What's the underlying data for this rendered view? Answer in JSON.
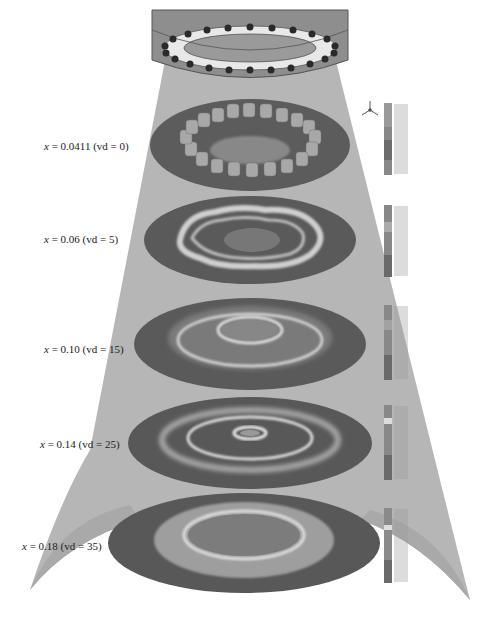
{
  "figure": {
    "colors": {
      "cone": "#b4b4b4",
      "nozzle": "#8e8e8e",
      "disc_outer": "#5a5a5a",
      "disc_mid": "#7a7a7a",
      "ring_light": "#d6d6d6",
      "background": "#ffffff"
    },
    "nozzle": {
      "orifice_count": 24,
      "orifice_color": "#2a2a2a"
    },
    "slices": [
      {
        "x_label": "x",
        "x_value": "= 0.0411",
        "vd_label": "(vd = 0)",
        "pattern": "discrete-jets"
      },
      {
        "x_label": "x",
        "x_value": "= 0.06",
        "vd_label": "(vd = 5)",
        "pattern": "wavy-ring"
      },
      {
        "x_label": "x",
        "x_value": "= 0.10",
        "vd_label": "(vd = 15)",
        "pattern": "double-ring"
      },
      {
        "x_label": "x",
        "x_value": "= 0.14",
        "vd_label": "(vd = 25)",
        "pattern": "triple-ring"
      },
      {
        "x_label": "x",
        "x_value": "= 0.18",
        "vd_label": "(vd = 35)",
        "pattern": "single-ring"
      }
    ],
    "axis_triad_icon": "xyz-triad-icon",
    "legend_count": 5
  }
}
